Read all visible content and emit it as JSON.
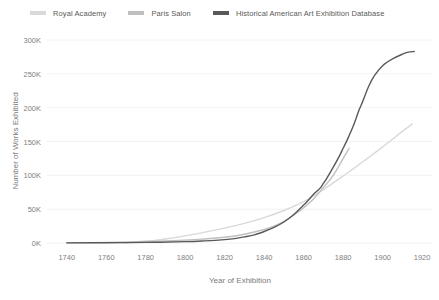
{
  "legend": {
    "position": "top-left",
    "items": [
      {
        "label": "Royal Academy",
        "color": "#d9d9d9",
        "icon": "line-swatch-icon"
      },
      {
        "label": "Paris Salon",
        "color": "#bfbfbf",
        "icon": "line-swatch-icon"
      },
      {
        "label": "Historical American Art Exhibition Database",
        "color": "#595959",
        "icon": "line-swatch-icon"
      }
    ]
  },
  "axes": {
    "x_title": "Year of Exhibition",
    "y_title": "Number of Works Exhibited",
    "x_ticks": [
      "1740",
      "1760",
      "1780",
      "1800",
      "1820",
      "1840",
      "1860",
      "1880",
      "1900",
      "1920"
    ],
    "y_ticks": [
      "0K",
      "50K",
      "100K",
      "150K",
      "200K",
      "250K",
      "300K"
    ],
    "grid_color": "#f2f2f2",
    "tick_color": "#808080"
  },
  "chart_data": {
    "type": "line",
    "title": "",
    "xlabel": "Year of Exhibition",
    "ylabel": "Number of Works Exhibited",
    "xlim": [
      1730,
      1925
    ],
    "ylim": [
      0,
      300000
    ],
    "xticks": [
      1740,
      1760,
      1780,
      1800,
      1820,
      1840,
      1860,
      1880,
      1900,
      1920
    ],
    "yticks": [
      0,
      50000,
      100000,
      150000,
      200000,
      250000,
      300000
    ],
    "grid": true,
    "legend_position": "top-left",
    "series": [
      {
        "name": "Royal Academy",
        "color": "#d9d9d9",
        "x": [
          1769,
          1780,
          1790,
          1800,
          1810,
          1820,
          1830,
          1840,
          1850,
          1860,
          1870,
          1880,
          1890,
          1900,
          1910,
          1915
        ],
        "y": [
          300,
          2500,
          6000,
          10500,
          16000,
          22000,
          29000,
          37500,
          48000,
          61000,
          79000,
          99000,
          120000,
          142000,
          165000,
          176000
        ]
      },
      {
        "name": "Paris Salon",
        "color": "#bfbfbf",
        "x": [
          1740,
          1760,
          1780,
          1800,
          1810,
          1820,
          1830,
          1840,
          1845,
          1850,
          1855,
          1860,
          1865,
          1870,
          1875,
          1880,
          1883
        ],
        "y": [
          200,
          900,
          2200,
          4200,
          6000,
          8500,
          13000,
          20000,
          25000,
          32000,
          41000,
          52000,
          65000,
          82000,
          100000,
          125000,
          140000
        ]
      },
      {
        "name": "Historical American Art Exhibition Database",
        "color": "#595959",
        "x": [
          1740,
          1760,
          1780,
          1800,
          1810,
          1820,
          1825,
          1830,
          1835,
          1840,
          1845,
          1850,
          1855,
          1860,
          1862,
          1865,
          1868,
          1870,
          1872,
          1875,
          1878,
          1880,
          1882,
          1885,
          1888,
          1890,
          1893,
          1896,
          1900,
          1905,
          1910,
          1913,
          1916
        ],
        "y": [
          200,
          400,
          900,
          2000,
          3200,
          5000,
          6500,
          9000,
          12000,
          17000,
          23000,
          31000,
          42000,
          56000,
          62000,
          72000,
          80000,
          88000,
          97000,
          112000,
          128000,
          140000,
          152000,
          172000,
          196000,
          210000,
          232000,
          248000,
          262000,
          272000,
          279000,
          282000,
          283000
        ]
      }
    ]
  }
}
